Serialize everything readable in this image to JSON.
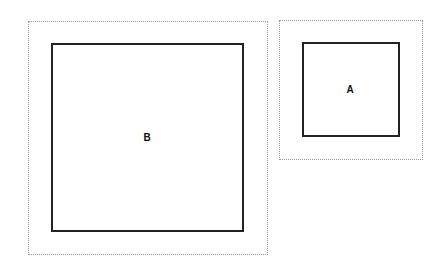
{
  "diagram": {
    "boxes": [
      {
        "id": "B",
        "label": "B"
      },
      {
        "id": "A",
        "label": "A"
      }
    ]
  }
}
